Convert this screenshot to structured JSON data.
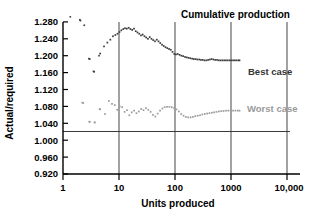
{
  "chart_data": {
    "type": "scatter",
    "title": "Cumulative production",
    "xlabel": "Units produced",
    "ylabel": "Actual/required",
    "xscale": "log",
    "xlim": [
      1,
      10000
    ],
    "ylim": [
      0.92,
      1.28
    ],
    "grid": "vertical-gridlines-at-decades",
    "legend_position": "right-inside",
    "xticks": [
      "1",
      "10",
      "100",
      "1000",
      "10,000"
    ],
    "xtick_values": [
      1,
      10,
      100,
      1000,
      10000
    ],
    "yticks": [
      "0.920",
      "0.960",
      "1.000",
      "1.040",
      "1.080",
      "1.120",
      "1.160",
      "1.200",
      "1.240",
      "1.280"
    ],
    "ytick_values": [
      0.92,
      0.96,
      1.0,
      1.04,
      1.08,
      1.12,
      1.16,
      1.2,
      1.24,
      1.28
    ],
    "reference_line": {
      "y": 1.0,
      "label": "1.000"
    },
    "colors": {
      "best_case": "#3c3c3c",
      "worst_case": "#9a9a9a",
      "axis": "#000000",
      "gridline": "#555555"
    },
    "series": [
      {
        "name": "Best case",
        "color": "#3c3c3c",
        "points": [
          [
            2.0,
            1.285
          ],
          [
            2.4,
            1.272
          ],
          [
            3.0,
            1.192
          ],
          [
            3.6,
            1.162
          ],
          [
            4.6,
            1.205
          ],
          [
            5.4,
            1.222
          ],
          [
            6.2,
            1.231
          ],
          [
            7.0,
            1.238
          ],
          [
            7.8,
            1.246
          ],
          [
            8.6,
            1.249
          ],
          [
            9.4,
            1.252
          ],
          [
            10.2,
            1.256
          ],
          [
            11.0,
            1.26
          ],
          [
            11.9,
            1.263
          ],
          [
            12.8,
            1.265
          ],
          [
            13.8,
            1.264
          ],
          [
            14.9,
            1.266
          ],
          [
            16.0,
            1.263
          ],
          [
            17.2,
            1.261
          ],
          [
            18.5,
            1.264
          ],
          [
            19.9,
            1.258
          ],
          [
            21.4,
            1.255
          ],
          [
            23.0,
            1.252
          ],
          [
            24.7,
            1.248
          ],
          [
            26.5,
            1.25
          ],
          [
            28.5,
            1.246
          ],
          [
            30.6,
            1.243
          ],
          [
            32.9,
            1.24
          ],
          [
            35.4,
            1.244
          ],
          [
            38.0,
            1.24
          ],
          [
            40.8,
            1.237
          ],
          [
            43.9,
            1.234
          ],
          [
            47.2,
            1.238
          ],
          [
            50.7,
            1.234
          ],
          [
            54.5,
            1.23
          ],
          [
            58.6,
            1.226
          ],
          [
            63.0,
            1.223
          ],
          [
            67.7,
            1.22
          ],
          [
            72.7,
            1.218
          ],
          [
            78.2,
            1.216
          ],
          [
            84.0,
            1.214
          ],
          [
            90.3,
            1.209
          ],
          [
            97.1,
            1.204
          ],
          [
            104.0,
            1.203
          ],
          [
            112.0,
            1.204
          ],
          [
            121.0,
            1.202
          ],
          [
            130.0,
            1.2
          ],
          [
            140.0,
            1.199
          ],
          [
            151.0,
            1.197
          ],
          [
            162.0,
            1.196
          ],
          [
            174.0,
            1.195
          ],
          [
            187.0,
            1.194
          ],
          [
            202.0,
            1.193
          ],
          [
            217.0,
            1.192
          ],
          [
            234.0,
            1.192
          ],
          [
            251.0,
            1.191
          ],
          [
            271.0,
            1.191
          ],
          [
            291.0,
            1.19
          ],
          [
            313.0,
            1.19
          ],
          [
            337.0,
            1.189
          ],
          [
            363.0,
            1.189
          ],
          [
            390.0,
            1.19
          ],
          [
            420.0,
            1.191
          ],
          [
            452.0,
            1.192
          ],
          [
            486.0,
            1.191
          ],
          [
            523.0,
            1.19
          ],
          [
            563.0,
            1.19
          ],
          [
            606.0,
            1.189
          ],
          [
            652.0,
            1.189
          ],
          [
            701.0,
            1.189
          ],
          [
            755.0,
            1.189
          ],
          [
            812.0,
            1.189
          ],
          [
            874.0,
            1.189
          ],
          [
            940.0,
            1.189
          ],
          [
            1012.0,
            1.189
          ],
          [
            1089.0,
            1.189
          ],
          [
            1171.0,
            1.189
          ],
          [
            1260.0,
            1.189
          ],
          [
            1356.0,
            1.189
          ],
          [
            1420.0,
            1.189
          ]
        ]
      },
      {
        "name": "Worst case",
        "color": "#9a9a9a",
        "points": [
          [
            2.3,
            1.088
          ],
          [
            3.0,
            1.043
          ],
          [
            3.7,
            1.042
          ],
          [
            4.6,
            1.073
          ],
          [
            5.6,
            1.062
          ],
          [
            6.6,
            1.093
          ],
          [
            7.5,
            1.086
          ],
          [
            8.4,
            1.083
          ],
          [
            9.3,
            1.072
          ],
          [
            10.3,
            1.08
          ],
          [
            11.4,
            1.078
          ],
          [
            12.6,
            1.067
          ],
          [
            13.9,
            1.071
          ],
          [
            15.3,
            1.059
          ],
          [
            16.9,
            1.066
          ],
          [
            18.6,
            1.07
          ],
          [
            20.5,
            1.064
          ],
          [
            22.6,
            1.068
          ],
          [
            24.9,
            1.074
          ],
          [
            27.4,
            1.071
          ],
          [
            30.2,
            1.076
          ],
          [
            33.3,
            1.072
          ],
          [
            36.7,
            1.067
          ],
          [
            40.4,
            1.06
          ],
          [
            44.5,
            1.056
          ],
          [
            49.0,
            1.063
          ],
          [
            54.0,
            1.07
          ],
          [
            59.5,
            1.075
          ],
          [
            65.5,
            1.078
          ],
          [
            72.2,
            1.079
          ],
          [
            79.5,
            1.079
          ],
          [
            87.6,
            1.078
          ],
          [
            96.5,
            1.076
          ],
          [
            106.0,
            1.073
          ],
          [
            117.0,
            1.068
          ],
          [
            129.0,
            1.062
          ],
          [
            142.0,
            1.058
          ],
          [
            156.0,
            1.055
          ],
          [
            172.0,
            1.054
          ],
          [
            190.0,
            1.054
          ],
          [
            209.0,
            1.055
          ],
          [
            230.0,
            1.057
          ],
          [
            254.0,
            1.058
          ],
          [
            280.0,
            1.059
          ],
          [
            308.0,
            1.061
          ],
          [
            340.0,
            1.062
          ],
          [
            374.0,
            1.063
          ],
          [
            412.0,
            1.064
          ],
          [
            454.0,
            1.065
          ],
          [
            500.0,
            1.066
          ],
          [
            551.0,
            1.067
          ],
          [
            607.0,
            1.068
          ],
          [
            669.0,
            1.069
          ],
          [
            737.0,
            1.069
          ],
          [
            812.0,
            1.07
          ],
          [
            895.0,
            1.07
          ],
          [
            986.0,
            1.07
          ],
          [
            1086.0,
            1.07
          ],
          [
            1197.0,
            1.07
          ],
          [
            1319.0,
            1.07
          ],
          [
            1420.0,
            1.07
          ]
        ]
      }
    ],
    "early_scatter": [
      {
        "series": "Best case",
        "points": [
          [
            1.35,
            1.292
          ],
          [
            2.05,
            1.283
          ],
          [
            2.9,
            1.193
          ],
          [
            3.5,
            1.163
          ],
          [
            4.4,
            1.2
          ]
        ]
      },
      {
        "series": "Worst case",
        "points": [
          [
            2.2,
            1.089
          ],
          [
            2.95,
            1.044
          ],
          [
            3.65,
            1.042
          ],
          [
            4.5,
            1.074
          ]
        ]
      }
    ]
  },
  "legend": {
    "best_case": "Best case",
    "worst_case": "Worst case"
  }
}
